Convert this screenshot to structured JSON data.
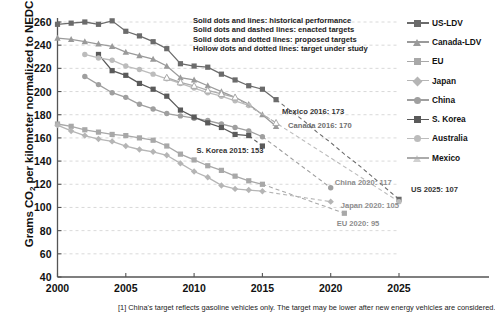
{
  "chart_data": {
    "type": "line",
    "title": "",
    "xlabel": "",
    "ylabel": "Grams CO2 per kilometer normalized to NEDC",
    "ylabel_rich": {
      "pre": "Grams CO",
      "sub": "2",
      "post": " per kilometer normalized to NEDC"
    },
    "xlim": [
      2000,
      2025
    ],
    "ylim": [
      40,
      260
    ],
    "yticks": [
      40,
      60,
      80,
      100,
      120,
      140,
      160,
      180,
      200,
      220,
      240,
      260
    ],
    "xticks": [
      2000,
      2005,
      2010,
      2015,
      2020,
      2025
    ],
    "grid": "horizontal-dashed",
    "legend_position": "right",
    "series": [
      {
        "name": "US-LDV",
        "color": "#6b6b6b",
        "marker": "square",
        "historical": [
          {
            "x": 2000,
            "y": 258
          },
          {
            "x": 2001,
            "y": 259
          },
          {
            "x": 2002,
            "y": 260
          },
          {
            "x": 2003,
            "y": 258
          },
          {
            "x": 2004,
            "y": 261
          },
          {
            "x": 2005,
            "y": 252
          },
          {
            "x": 2006,
            "y": 248
          },
          {
            "x": 2007,
            "y": 243
          },
          {
            "x": 2008,
            "y": 237
          },
          {
            "x": 2009,
            "y": 224
          },
          {
            "x": 2010,
            "y": 222
          },
          {
            "x": 2011,
            "y": 221
          },
          {
            "x": 2012,
            "y": 215
          },
          {
            "x": 2013,
            "y": 210
          },
          {
            "x": 2014,
            "y": 205
          },
          {
            "x": 2015,
            "y": 202
          },
          {
            "x": 2016,
            "y": 193
          }
        ],
        "enacted_target": [
          {
            "x": 2016,
            "y": 193
          },
          {
            "x": 2017,
            "y": 184
          },
          {
            "x": 2018,
            "y": 175
          },
          {
            "x": 2019,
            "y": 165
          },
          {
            "x": 2020,
            "y": 156
          },
          {
            "x": 2021,
            "y": 146
          },
          {
            "x": 2022,
            "y": 137
          },
          {
            "x": 2023,
            "y": 127
          },
          {
            "x": 2024,
            "y": 117
          },
          {
            "x": 2025,
            "y": 107
          }
        ]
      },
      {
        "name": "Canada-LDV",
        "color": "#9a9a9a",
        "marker": "triangle",
        "historical": [
          {
            "x": 2000,
            "y": 246
          },
          {
            "x": 2001,
            "y": 245
          },
          {
            "x": 2002,
            "y": 243
          },
          {
            "x": 2003,
            "y": 241
          },
          {
            "x": 2004,
            "y": 239
          },
          {
            "x": 2005,
            "y": 234
          },
          {
            "x": 2006,
            "y": 231
          },
          {
            "x": 2007,
            "y": 228
          },
          {
            "x": 2008,
            "y": 222
          },
          {
            "x": 2009,
            "y": 212
          },
          {
            "x": 2010,
            "y": 210
          },
          {
            "x": 2011,
            "y": 205
          },
          {
            "x": 2012,
            "y": 200
          },
          {
            "x": 2013,
            "y": 195
          },
          {
            "x": 2014,
            "y": 189
          },
          {
            "x": 2015,
            "y": 180
          },
          {
            "x": 2016,
            "y": 170
          }
        ],
        "enacted_target": []
      },
      {
        "name": "EU",
        "color": "#a8a8a8",
        "marker": "square",
        "historical": [
          {
            "x": 2000,
            "y": 172
          },
          {
            "x": 2001,
            "y": 170
          },
          {
            "x": 2002,
            "y": 167
          },
          {
            "x": 2003,
            "y": 165
          },
          {
            "x": 2004,
            "y": 163
          },
          {
            "x": 2005,
            "y": 162
          },
          {
            "x": 2006,
            "y": 160
          },
          {
            "x": 2007,
            "y": 158
          },
          {
            "x": 2008,
            "y": 153
          },
          {
            "x": 2009,
            "y": 146
          },
          {
            "x": 2010,
            "y": 141
          },
          {
            "x": 2011,
            "y": 136
          },
          {
            "x": 2012,
            "y": 132
          },
          {
            "x": 2013,
            "y": 127
          },
          {
            "x": 2014,
            "y": 123
          },
          {
            "x": 2015,
            "y": 120
          }
        ],
        "enacted_target": [
          {
            "x": 2015,
            "y": 120
          },
          {
            "x": 2021,
            "y": 95
          }
        ]
      },
      {
        "name": "Japan",
        "color": "#b5b5b5",
        "marker": "diamond",
        "historical": [
          {
            "x": 2000,
            "y": 171
          },
          {
            "x": 2001,
            "y": 166
          },
          {
            "x": 2002,
            "y": 162
          },
          {
            "x": 2003,
            "y": 159
          },
          {
            "x": 2004,
            "y": 157
          },
          {
            "x": 2005,
            "y": 153
          },
          {
            "x": 2006,
            "y": 150
          },
          {
            "x": 2007,
            "y": 148
          },
          {
            "x": 2008,
            "y": 145
          },
          {
            "x": 2009,
            "y": 138
          },
          {
            "x": 2010,
            "y": 131
          },
          {
            "x": 2011,
            "y": 126
          },
          {
            "x": 2012,
            "y": 119
          },
          {
            "x": 2013,
            "y": 116
          },
          {
            "x": 2014,
            "y": 115
          },
          {
            "x": 2015,
            "y": 114
          }
        ],
        "enacted_target": [
          {
            "x": 2015,
            "y": 114
          },
          {
            "x": 2020,
            "y": 105
          }
        ]
      },
      {
        "name": "China",
        "color": "#9f9f9f",
        "marker": "circle",
        "historical": [
          {
            "x": 2002,
            "y": 213
          },
          {
            "x": 2003,
            "y": 206
          },
          {
            "x": 2004,
            "y": 199
          },
          {
            "x": 2005,
            "y": 195
          },
          {
            "x": 2006,
            "y": 189
          },
          {
            "x": 2007,
            "y": 185
          },
          {
            "x": 2008,
            "y": 181
          },
          {
            "x": 2009,
            "y": 179
          },
          {
            "x": 2010,
            "y": 177
          },
          {
            "x": 2011,
            "y": 175
          },
          {
            "x": 2012,
            "y": 172
          },
          {
            "x": 2013,
            "y": 169
          },
          {
            "x": 2014,
            "y": 166
          },
          {
            "x": 2015,
            "y": 161
          }
        ],
        "enacted_target": [
          {
            "x": 2015,
            "y": 161
          },
          {
            "x": 2020,
            "y": 117
          }
        ]
      },
      {
        "name": "S. Korea",
        "color": "#5a5a5a",
        "marker": "square",
        "historical": [
          {
            "x": 2003,
            "y": 232
          },
          {
            "x": 2004,
            "y": 218
          },
          {
            "x": 2005,
            "y": 214
          },
          {
            "x": 2006,
            "y": 207
          },
          {
            "x": 2007,
            "y": 202
          },
          {
            "x": 2008,
            "y": 196
          },
          {
            "x": 2009,
            "y": 184
          },
          {
            "x": 2010,
            "y": 178
          },
          {
            "x": 2011,
            "y": 173
          },
          {
            "x": 2012,
            "y": 169
          },
          {
            "x": 2013,
            "y": 163
          },
          {
            "x": 2014,
            "y": 162
          }
        ],
        "enacted_target": [
          {
            "x": 2014,
            "y": 162
          },
          {
            "x": 2015,
            "y": 153
          }
        ]
      },
      {
        "name": "Australia",
        "color": "#bcbcbc",
        "marker": "circle",
        "historical": [
          {
            "x": 2002,
            "y": 232
          },
          {
            "x": 2003,
            "y": 229
          },
          {
            "x": 2004,
            "y": 227
          },
          {
            "x": 2005,
            "y": 222
          },
          {
            "x": 2006,
            "y": 219
          },
          {
            "x": 2007,
            "y": 215
          },
          {
            "x": 2008,
            "y": 211
          },
          {
            "x": 2009,
            "y": 207
          },
          {
            "x": 2010,
            "y": 203
          },
          {
            "x": 2011,
            "y": 199
          },
          {
            "x": 2012,
            "y": 196
          },
          {
            "x": 2013,
            "y": 192
          },
          {
            "x": 2014,
            "y": 188
          }
        ],
        "enacted_target": [
          {
            "x": 2014,
            "y": 188
          },
          {
            "x": 2025,
            "y": 105
          }
        ]
      },
      {
        "name": "Mexico",
        "color": "#ababab",
        "marker": "triangle-hollow",
        "historical": [
          {
            "x": 2008,
            "y": 212
          },
          {
            "x": 2009,
            "y": 208
          },
          {
            "x": 2010,
            "y": 205
          },
          {
            "x": 2011,
            "y": 201
          },
          {
            "x": 2012,
            "y": 198
          },
          {
            "x": 2013,
            "y": 195
          }
        ],
        "enacted_target": [
          {
            "x": 2013,
            "y": 195
          },
          {
            "x": 2016,
            "y": 173
          }
        ]
      }
    ],
    "annotations": [
      {
        "text": "Mexico 2016: 173",
        "x": 2016,
        "y": 173
      },
      {
        "text": "Canada 2016: 170",
        "x": 2016,
        "y": 170
      },
      {
        "text": "S. Korea 2015: 153",
        "x": 2015,
        "y": 153
      },
      {
        "text": "China 2020: 117",
        "x": 2020,
        "y": 117
      },
      {
        "text": "Japan 2020: 105",
        "x": 2020,
        "y": 105
      },
      {
        "text": "EU 2020: 95",
        "x": 2020,
        "y": 95
      },
      {
        "text": "US 2025: 107",
        "x": 2025,
        "y": 107
      }
    ]
  },
  "key_note": {
    "lines": [
      "Solid dots and lines: historical performance",
      "Solid dots and dashed lines: enacted targets",
      "Solid dots and dotted lines: proposed targets",
      "Hollow dots and dotted lines: target under study"
    ]
  },
  "legend": {
    "items": [
      {
        "label": "US-LDV",
        "color": "#6b6b6b",
        "marker": "square"
      },
      {
        "label": "Canada-LDV",
        "color": "#9a9a9a",
        "marker": "triangle"
      },
      {
        "label": "EU",
        "color": "#a8a8a8",
        "marker": "square"
      },
      {
        "label": "Japan",
        "color": "#b5b5b5",
        "marker": "diamond"
      },
      {
        "label": "China",
        "color": "#9f9f9f",
        "marker": "circle"
      },
      {
        "label": "S. Korea",
        "color": "#5a5a5a",
        "marker": "square"
      },
      {
        "label": "Australia",
        "color": "#bcbcbc",
        "marker": "circle"
      },
      {
        "label": "Mexico",
        "color": "#ababab",
        "marker": "triangle-hollow"
      }
    ]
  },
  "footnote": {
    "text": "[1] China's target reflects gasoline vehicles only. The target may be lower after new energy vehicles are considered."
  }
}
